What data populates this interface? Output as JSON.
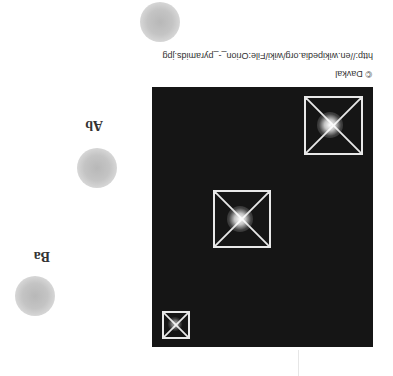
{
  "figure": {
    "copyright": "© Davkal",
    "source_url": "http://en.wikipedia.org/wiki/File:Orion_-_pyramids.jpg",
    "orientation": "rotated-180",
    "panel_color": "#151515",
    "pyramid_outline_color": "#e8e8e8"
  },
  "labels": {
    "top": "Ab",
    "bottom": "Ba"
  },
  "pyramids": [
    {
      "name": "large",
      "size": 59
    },
    {
      "name": "medium",
      "size": 58
    },
    {
      "name": "small",
      "size": 28
    }
  ],
  "stars": [
    {
      "name": "star-1"
    },
    {
      "name": "star-2"
    },
    {
      "name": "star-3"
    }
  ]
}
